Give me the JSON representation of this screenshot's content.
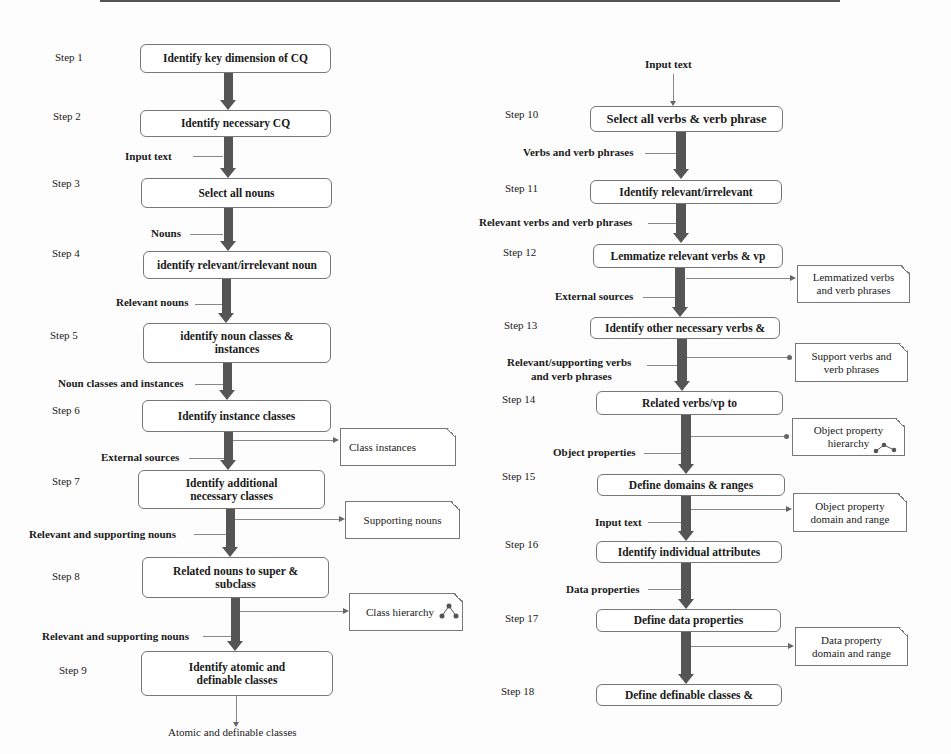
{
  "left_flow": {
    "steps": [
      {
        "step": "Step 1",
        "label": "Identify key dimension of CQ"
      },
      {
        "step": "Step 2",
        "label": "Identify necessary CQ"
      },
      {
        "step": "Step 3",
        "label": "Select all nouns"
      },
      {
        "step": "Step 4",
        "label": "identify relevant/irrelevant noun"
      },
      {
        "step": "Step 5",
        "label": "identify noun classes & instances"
      },
      {
        "step": "Step 6",
        "label": "Identify instance classes"
      },
      {
        "step": "Step 7",
        "label": "Identify additional necessary classes"
      },
      {
        "step": "Step 8",
        "label": "Related nouns to super & subclass"
      },
      {
        "step": "Step 9",
        "label": "Identify atomic and definable classes"
      }
    ],
    "inputs": [
      "Input text",
      "Nouns",
      "Relevant nouns",
      "Noun classes and instances",
      "External sources",
      "Relevant and supporting nouns",
      "Relevant and supporting nouns"
    ],
    "outputs": [
      "Class instances",
      "Supporting nouns",
      "Class hierarchy"
    ],
    "final_output": "Atomic and definable classes"
  },
  "right_flow": {
    "top_input": "Input text",
    "steps": [
      {
        "step": "Step 10",
        "label": "Select all verbs & verb phrase"
      },
      {
        "step": "Step 11",
        "label": "Identify relevant/irrelevant"
      },
      {
        "step": "Step 12",
        "label": "Lemmatize relevant verbs & vp"
      },
      {
        "step": "Step 13",
        "label": "Identify other necessary verbs &"
      },
      {
        "step": "Step 14",
        "label": "Related verbs/vp to"
      },
      {
        "step": "Step 15",
        "label": "Define domains & ranges"
      },
      {
        "step": "Step 16",
        "label": "Identify individual attributes"
      },
      {
        "step": "Step 17",
        "label": "Define data properties"
      },
      {
        "step": "Step 18",
        "label": "Define definable classes &"
      }
    ],
    "inputs": [
      "Verbs and verb phrases",
      "Relevant verbs and verb phrases",
      "External sources",
      "Relevant/supporting verbs",
      "and verb phrases",
      "Object properties",
      "Input text",
      "Data properties"
    ],
    "outputs": [
      {
        "line1": "Lemmatized verbs",
        "line2": "and verb phrases"
      },
      {
        "line1": "Support verbs and",
        "line2": "verb phrases"
      },
      {
        "line1": "Object property",
        "line2": "hierarchy"
      },
      {
        "line1": "Object property",
        "line2": "domain and range"
      },
      {
        "line1": "Data property",
        "line2": "domain and range"
      }
    ]
  },
  "colors": {
    "arrow": "#555555",
    "border": "#777777",
    "connector": "#888888"
  }
}
